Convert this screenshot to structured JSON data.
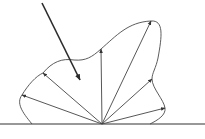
{
  "diagram": {
    "type": "reflectance-lobe",
    "colors": {
      "background": "#ffffff",
      "line": "#444444",
      "incident": "#2b2b2b"
    },
    "surface": {
      "y": 124,
      "x1": 0,
      "x2": 205
    },
    "origin": {
      "x": 102,
      "y": 124
    },
    "incident_ray": {
      "from": [
        42,
        3
      ],
      "to": [
        80,
        80
      ]
    },
    "reflected_rays": [
      {
        "to": [
          22,
          95
        ]
      },
      {
        "to": [
          43,
          73
        ]
      },
      {
        "to": [
          101,
          49
        ]
      },
      {
        "to": [
          151,
          21
        ]
      },
      {
        "to": [
          152,
          79
        ]
      },
      {
        "to": [
          165,
          108
        ]
      }
    ],
    "lobe_path": "M32,124 C22,112 16,103 22,95 C28,85 36,76 43,73 C52,62 62,58 74,60 C86,61 92,57 101,49 C116,36 128,22 151,21 C164,20 162,36 158,58 C156,68 152,73 152,79 C152,88 164,100 165,108 C166,115 158,120 150,124"
  }
}
